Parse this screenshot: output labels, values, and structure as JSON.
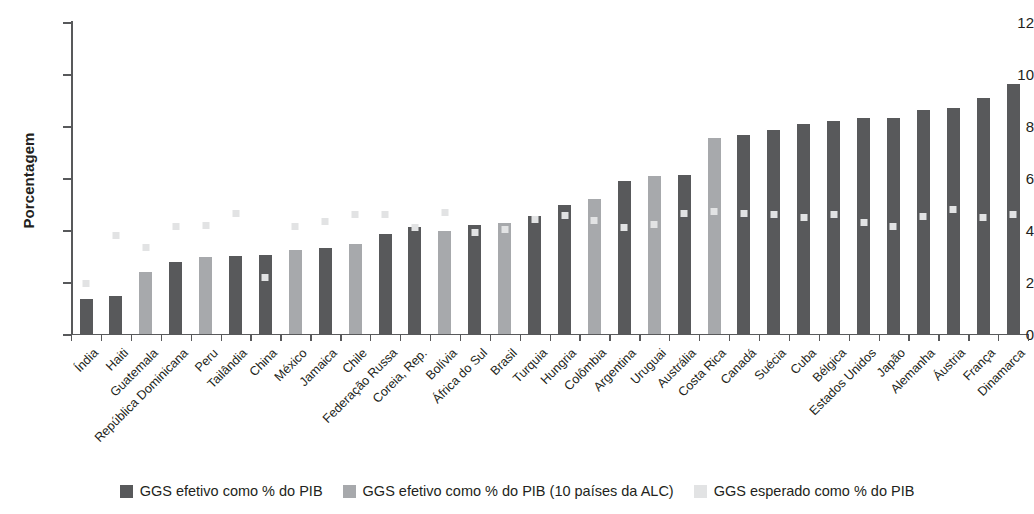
{
  "chart_data": {
    "type": "bar",
    "title": "",
    "xlabel": "",
    "ylabel": "Porcentagem",
    "ylim": [
      0,
      12
    ],
    "yticks": [
      0,
      2,
      4,
      6,
      8,
      10,
      12
    ],
    "ytick_labels": [
      "0",
      "2",
      "4",
      "6",
      "8",
      "10",
      "12"
    ],
    "grid": false,
    "legend_position": "bottom",
    "categories": [
      "Índia",
      "Haiti",
      "Guatemala",
      "República Dominicana",
      "Peru",
      "Tailândia",
      "China",
      "México",
      "Jamaica",
      "Chile",
      "Federação Russa",
      "Coreia, Rep.",
      "Bolívia",
      "África do Sul",
      "Brasil",
      "Turquia",
      "Hungria",
      "Colômbia",
      "Argentina",
      "Uruguai",
      "Austrália",
      "Costa Rica",
      "Canadá",
      "Suécia",
      "Cuba",
      "Bélgica",
      "Estados Unidos",
      "Japão",
      "Alemanha",
      "Áustria",
      "França",
      "Dinamarca"
    ],
    "series": [
      {
        "name": "GGS efetivo como % do PIB",
        "key": "effective",
        "color": "#58595b",
        "values": [
          1.35,
          1.47,
          null,
          2.78,
          null,
          3.0,
          3.05,
          null,
          3.3,
          null,
          3.85,
          4.1,
          null,
          4.2,
          null,
          4.55,
          4.98,
          null,
          5.88,
          null,
          6.1,
          null,
          7.65,
          7.85,
          8.08,
          8.2,
          8.3,
          8.3,
          8.6,
          8.68,
          9.08,
          9.6
        ]
      },
      {
        "name": "GGS efetivo como % do PIB (10 países da ALC)",
        "key": "lac",
        "color": "#a7a9ac",
        "values": [
          null,
          null,
          2.4,
          null,
          2.98,
          null,
          null,
          3.22,
          null,
          3.48,
          null,
          null,
          3.95,
          null,
          4.28,
          null,
          null,
          5.2,
          null,
          6.08,
          null,
          7.55,
          null,
          null,
          null,
          null,
          null,
          null,
          null,
          null,
          null,
          null
        ]
      },
      {
        "name": "GGS esperado como % do PIB",
        "key": "expected",
        "color": "#e2e3e4",
        "marker": "square",
        "values": [
          1.95,
          3.78,
          3.33,
          4.12,
          4.18,
          4.62,
          2.18,
          4.12,
          4.32,
          4.58,
          4.58,
          4.08,
          4.68,
          3.9,
          4.02,
          4.42,
          4.55,
          4.38,
          4.08,
          4.22,
          4.62,
          4.72,
          4.62,
          4.58,
          4.48,
          4.6,
          4.28,
          4.12,
          4.52,
          4.78,
          4.48,
          4.58
        ]
      }
    ]
  },
  "legend": {
    "items": [
      {
        "label": "GGS efetivo como % do PIB",
        "swatch": "sw-effective",
        "name": "legend-swatch-effective"
      },
      {
        "label": "GGS efetivo como % do PIB (10 países da ALC)",
        "swatch": "sw-lac",
        "name": "legend-swatch-lac"
      },
      {
        "label": "GGS esperado como % do PIB",
        "swatch": "sw-expected",
        "name": "legend-swatch-expected"
      }
    ]
  }
}
